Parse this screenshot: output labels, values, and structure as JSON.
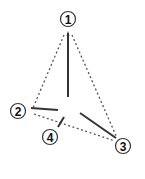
{
  "diagram": {
    "type": "tetrahedral-geometry",
    "colors": {
      "solid": "#333333",
      "dotted": "#555555",
      "circle_stroke": "#333333",
      "label": "#111111"
    },
    "vertices": [
      {
        "id": "1",
        "label": "1",
        "cx": 68,
        "cy": 19
      },
      {
        "id": "2",
        "label": "2",
        "cx": 18,
        "cy": 111
      },
      {
        "id": "3",
        "label": "3",
        "cx": 123,
        "cy": 146
      },
      {
        "id": "4",
        "label": "4",
        "cx": 50,
        "cy": 137
      }
    ],
    "solid_bonds": [
      "center-1",
      "center-2",
      "center-3",
      "center-4"
    ],
    "dotted_edges": [
      "1-2",
      "1-3",
      "2-3"
    ]
  }
}
